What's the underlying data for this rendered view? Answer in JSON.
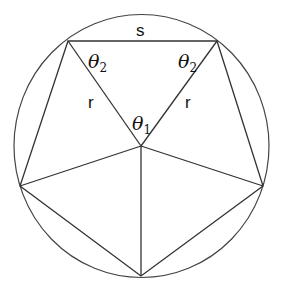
{
  "diagram": {
    "labels": {
      "side": "s",
      "radius_left": "r",
      "radius_right": "r",
      "theta": "θ",
      "central_angle_sub": "1",
      "base_angle_left_sub": "2",
      "base_angle_right_sub": "2"
    },
    "geometry": {
      "circle_center": [
        141,
        146
      ],
      "circle_radius": 128,
      "pentagon_vertices": [
        [
          68,
          41
        ],
        [
          217,
          41
        ],
        [
          263,
          186
        ],
        [
          141,
          276
        ],
        [
          20,
          186
        ]
      ],
      "pentagon_center": [
        141,
        146
      ]
    },
    "colors": {
      "stroke": "#333333",
      "background": "#ffffff"
    }
  }
}
